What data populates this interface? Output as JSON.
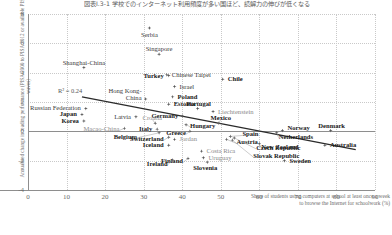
{
  "title_jp": "図表Ⅰ.3-1 学校でのインターネット利用頻度が多い国ほど、読解力の伸びが低くなる",
  "axes": {
    "y_label": "Annualised change in reading performance (PISA 2000 to PISA 2012 or available PISA waves)",
    "x_label_line1": "Share of students using computers at school at least once a week",
    "x_label_line2": "to browse the Internet for schoolwork (%)",
    "y_ticks": [
      "8",
      "6",
      "4",
      "2",
      "0",
      "-2",
      "-4"
    ],
    "x_ticks": [
      "0",
      "10",
      "20",
      "30",
      "40",
      "50",
      "60",
      "70",
      "80",
      "90"
    ]
  },
  "annotation": {
    "r_squared": "R² = 0.24"
  },
  "chart_data": {
    "type": "scatter",
    "title": "図表Ⅰ.3-1 学校でのインターネット利用頻度が多い国ほど、読解力の伸びが低くなる",
    "xlabel": "Share of students using computers at school at least once a week to browse the Internet for schoolwork (%)",
    "ylabel": "Annualised change in reading performance (PISA 2000 to PISA 2012 or available PISA waves)",
    "xlim": [
      0,
      90
    ],
    "ylim": [
      -4,
      8
    ],
    "grid": true,
    "legend": null,
    "r_squared": 0.24,
    "trendline": {
      "x0": 14,
      "y0": 2.35,
      "x1": 85,
      "y1": -1.25
    },
    "points": [
      {
        "label": "Serbia",
        "x": 31.5,
        "y": 7.05,
        "bold": false,
        "grey": false
      },
      {
        "label": "Singapore",
        "x": 34.0,
        "y": 5.25,
        "bold": false,
        "grey": false
      },
      {
        "label": "Shanghai-China",
        "x": 14.5,
        "y": 4.35,
        "bold": false,
        "grey": false
      },
      {
        "label": "Chinese Taipei",
        "x": 36.0,
        "y": 3.85,
        "bold": false,
        "grey": false
      },
      {
        "label": "Turkey",
        "x": 36.5,
        "y": 3.8,
        "bold": true,
        "grey": false
      },
      {
        "label": "Chile",
        "x": 50.5,
        "y": 3.55,
        "bold": true,
        "grey": false
      },
      {
        "label": "Israel",
        "x": 38.0,
        "y": 3.05,
        "bold": false,
        "grey": false
      },
      {
        "label": "Hong Kong-China",
        "x": 30.5,
        "y": 2.2,
        "bold": false,
        "grey": false
      },
      {
        "label": "Poland",
        "x": 37.5,
        "y": 2.35,
        "bold": true,
        "grey": false
      },
      {
        "label": "Estonia",
        "x": 36.5,
        "y": 1.85,
        "bold": true,
        "grey": false
      },
      {
        "label": "Liechtenstein",
        "x": 48.0,
        "y": 1.35,
        "bold": false,
        "grey": true
      },
      {
        "label": "Portugal",
        "x": 44.0,
        "y": 1.55,
        "bold": true,
        "grey": false
      },
      {
        "label": "Russian Federation",
        "x": 15.0,
        "y": 1.55,
        "bold": false,
        "grey": false
      },
      {
        "label": "Japan",
        "x": 14.0,
        "y": 1.15,
        "bold": true,
        "grey": false
      },
      {
        "label": "Korea",
        "x": 14.5,
        "y": 0.7,
        "bold": true,
        "grey": false
      },
      {
        "label": "Latvia",
        "x": 28.0,
        "y": 1.0,
        "bold": false,
        "grey": false
      },
      {
        "label": "Germany",
        "x": 40.0,
        "y": 1.05,
        "bold": true,
        "grey": false
      },
      {
        "label": "Croatia",
        "x": 33.0,
        "y": 0.55,
        "bold": false,
        "grey": true
      },
      {
        "label": "Hungary",
        "x": 41.0,
        "y": 0.45,
        "bold": true,
        "grey": false
      },
      {
        "label": "Mexico",
        "x": 49.5,
        "y": 0.55,
        "bold": true,
        "grey": false
      },
      {
        "label": "Macao-China",
        "x": 25.0,
        "y": 0.2,
        "bold": false,
        "grey": true
      },
      {
        "label": "Italy",
        "x": 33.5,
        "y": 0.15,
        "bold": true,
        "grey": false
      },
      {
        "label": "Greece",
        "x": 42.0,
        "y": 0.0,
        "bold": true,
        "grey": false
      },
      {
        "label": "Belgium",
        "x": 34.0,
        "y": -0.1,
        "bold": true,
        "grey": false
      },
      {
        "label": "Switzerland",
        "x": 36.5,
        "y": -0.4,
        "bold": true,
        "grey": false
      },
      {
        "label": "Spain",
        "x": 52.5,
        "y": -0.35,
        "bold": true,
        "grey": false
      },
      {
        "label": "Austria",
        "x": 51.5,
        "y": -0.55,
        "bold": true,
        "grey": false
      },
      {
        "label": "Jordan",
        "x": 38.0,
        "y": -0.55,
        "bold": false,
        "grey": true
      },
      {
        "label": "Iceland",
        "x": 36.5,
        "y": -0.95,
        "bold": true,
        "grey": false
      },
      {
        "label": "Norway",
        "x": 66.0,
        "y": 0.05,
        "bold": true,
        "grey": false
      },
      {
        "label": "Denmark",
        "x": 78.5,
        "y": 0.05,
        "bold": true,
        "grey": false
      },
      {
        "label": "Netherlands",
        "x": 64.5,
        "y": -0.1,
        "bold": true,
        "grey": false
      },
      {
        "label": "New Zealand",
        "x": 60.0,
        "y": -0.85,
        "bold": true,
        "grey": false
      },
      {
        "label": "Australia",
        "x": 77.0,
        "y": -0.95,
        "bold": true,
        "grey": false
      },
      {
        "label": "Czech Republic",
        "x": 53.5,
        "y": -0.45,
        "bold": true,
        "grey": false
      },
      {
        "label": "Slovak Republic",
        "x": 53.0,
        "y": -0.6,
        "bold": true,
        "grey": false
      },
      {
        "label": "Costa Rica",
        "x": 45.0,
        "y": -1.35,
        "bold": false,
        "grey": true
      },
      {
        "label": "Uruguay",
        "x": 45.5,
        "y": -1.8,
        "bold": false,
        "grey": true
      },
      {
        "label": "Slovenia",
        "x": 46.5,
        "y": -2.1,
        "bold": true,
        "grey": false
      },
      {
        "label": "Finland",
        "x": 41.5,
        "y": -1.85,
        "bold": true,
        "grey": false
      },
      {
        "label": "Ireland",
        "x": 37.5,
        "y": -1.95,
        "bold": true,
        "grey": false
      },
      {
        "label": "Sweden",
        "x": 66.5,
        "y": -2.0,
        "bold": true,
        "grey": false
      }
    ]
  }
}
